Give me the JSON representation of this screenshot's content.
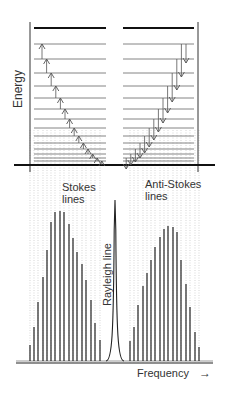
{
  "labels": {
    "energy_axis": "Energy",
    "stokes": [
      "Stokes",
      "lines"
    ],
    "anti_stokes": [
      "Anti-Stokes",
      "lines"
    ],
    "rayleigh": "Rayleigh line",
    "frequency_axis": "Frequency",
    "frequency_arrow": "→"
  },
  "energy_diagram": {
    "top_level_y": 28,
    "level_ys": [
      44,
      59,
      73,
      86,
      98,
      109,
      119,
      128,
      136,
      143,
      149,
      154,
      158,
      161
    ],
    "baseline_y": 165,
    "left_levels_x": [
      34,
      106
    ],
    "right_levels_x": [
      123,
      194
    ],
    "left_axis_x": 30,
    "right_axis_x": 198,
    "stokes_transitions": "upward arrows (absorption-type), staircase from top-left to bottom-right",
    "anti_stokes_transitions": "downward arrows, staircase from bottom-left to top-right"
  },
  "spectrum": {
    "baseline_y": 363,
    "stokes_lines": {
      "x": [
        30,
        34,
        38,
        43,
        47,
        51,
        55,
        60,
        64,
        69,
        73,
        77,
        82,
        86,
        91,
        95,
        100
      ],
      "top_y": [
        345,
        327,
        302,
        277,
        250,
        222,
        212,
        211,
        212,
        224,
        238,
        252,
        264,
        280,
        300,
        323,
        340
      ]
    },
    "rayleigh_line": {
      "x": 115,
      "top_y": 200
    },
    "anti_stokes_lines": {
      "x": [
        130,
        134,
        138,
        143,
        147,
        151,
        155,
        160,
        164,
        168,
        173,
        177,
        181,
        186,
        190,
        195,
        199
      ],
      "top_y": [
        341,
        327,
        305,
        286,
        273,
        260,
        247,
        237,
        229,
        226,
        227,
        232,
        260,
        284,
        307,
        332,
        347
      ]
    }
  },
  "colors": {
    "line": "#333333",
    "thin_level": "#666666",
    "arrow": "#555555",
    "dotted": "#bbbbbb"
  }
}
